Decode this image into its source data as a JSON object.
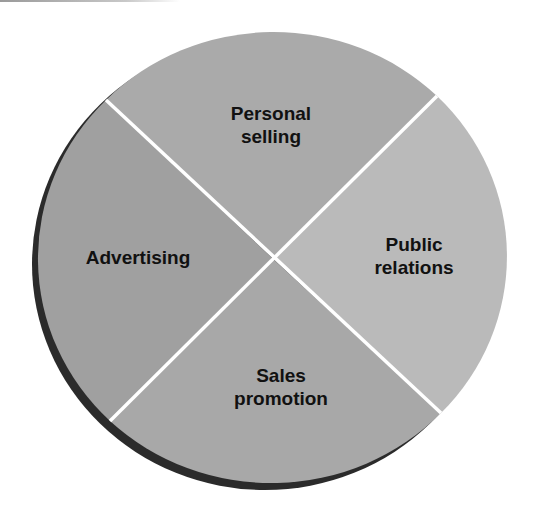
{
  "diagram": {
    "type": "pie",
    "segments": [
      {
        "id": "personal-selling",
        "line1": "Personal",
        "line2": "selling",
        "color": "#aaaaaa"
      },
      {
        "id": "public-relations",
        "line1": "Public",
        "line2": "relations",
        "color": "#bababa"
      },
      {
        "id": "sales-promotion",
        "line1": "Sales",
        "line2": "promotion",
        "color": "#a8a8a8"
      },
      {
        "id": "advertising",
        "line1": "Advertising",
        "line2": "",
        "color": "#a0a0a0"
      }
    ],
    "divider_color": "#ffffff",
    "shadow_color": "#2b2b2b"
  }
}
